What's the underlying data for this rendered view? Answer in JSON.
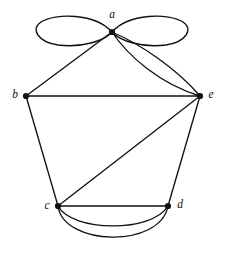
{
  "figure": {
    "type": "graph-diagram",
    "title": "",
    "background_color": "#ffffff",
    "stroke_color": "#111111",
    "width": 225,
    "height": 264
  },
  "graph_data": {
    "type": "multigraph",
    "directed": false,
    "vertex_count": 5,
    "edge_count": 11,
    "vertices": [
      {
        "id": "a",
        "label": "a",
        "x": 112,
        "y": 32,
        "label_x": 112,
        "label_y": 15,
        "degree": 8
      },
      {
        "id": "b",
        "label": "b",
        "x": 26,
        "y": 96,
        "label_x": 15,
        "label_y": 95,
        "degree": 3
      },
      {
        "id": "c",
        "label": "c",
        "x": 58,
        "y": 206,
        "label_x": 47,
        "label_y": 206,
        "degree": 6
      },
      {
        "id": "d",
        "label": "d",
        "x": 168,
        "y": 206,
        "label_x": 180,
        "label_y": 205,
        "degree": 4
      },
      {
        "id": "e",
        "label": "e",
        "x": 200,
        "y": 96,
        "label_x": 211,
        "label_y": 95,
        "degree": 5
      }
    ],
    "edges": [
      {
        "from": "a",
        "to": "a",
        "kind": "loop",
        "side": "left",
        "label": ""
      },
      {
        "from": "a",
        "to": "a",
        "kind": "loop",
        "side": "right",
        "label": ""
      },
      {
        "from": "a",
        "to": "b",
        "kind": "straight",
        "label": ""
      },
      {
        "from": "a",
        "to": "e",
        "kind": "curved",
        "bow": "outer",
        "label": ""
      },
      {
        "from": "a",
        "to": "e",
        "kind": "curved",
        "bow": "inner",
        "label": ""
      },
      {
        "from": "b",
        "to": "e",
        "kind": "straight",
        "label": ""
      },
      {
        "from": "b",
        "to": "c",
        "kind": "straight",
        "label": ""
      },
      {
        "from": "c",
        "to": "e",
        "kind": "straight",
        "label": ""
      },
      {
        "from": "d",
        "to": "e",
        "kind": "straight",
        "label": ""
      },
      {
        "from": "c",
        "to": "d",
        "kind": "straight",
        "label": ""
      },
      {
        "from": "c",
        "to": "d",
        "kind": "curved",
        "bow": "inner",
        "label": ""
      },
      {
        "from": "c",
        "to": "d",
        "kind": "curved",
        "bow": "outer",
        "label": ""
      }
    ],
    "loops": [
      {
        "vertex": "a",
        "side": "left",
        "extent_x": 37,
        "rx": 37,
        "ry": 14
      },
      {
        "vertex": "a",
        "side": "right",
        "extent_x": 188,
        "rx": 38,
        "ry": 14
      }
    ]
  }
}
